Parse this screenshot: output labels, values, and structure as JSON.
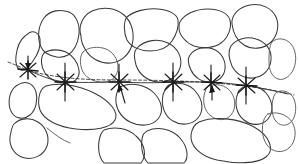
{
  "figure": {
    "background_color": "#ffffff",
    "stone_outline_color": "#3a3a3c",
    "reference_line_color": "#2a2a2c",
    "marker_color": "#171718",
    "width_px": 299,
    "height_px": 164
  },
  "reference_line": {
    "name": "horizontal-sight-line",
    "style": "solid-with-dashed-segments",
    "start": {
      "x": 8,
      "y": 62
    },
    "end": {
      "x": 294,
      "y": 95
    }
  },
  "markers": [
    {
      "id": "marker-1",
      "x": 28,
      "y": 70,
      "has_arrow": true,
      "arrow_direction": "down",
      "tick_length": 16
    },
    {
      "id": "marker-2",
      "x": 65,
      "y": 82,
      "has_arrow": false,
      "arrow_direction": "none",
      "tick_length": 22
    },
    {
      "id": "marker-3",
      "x": 119,
      "y": 82,
      "has_arrow": true,
      "arrow_direction": "down",
      "tick_length": 24
    },
    {
      "id": "marker-4",
      "x": 173,
      "y": 82,
      "has_arrow": false,
      "arrow_direction": "none",
      "tick_length": 24
    },
    {
      "id": "marker-5",
      "x": 211,
      "y": 81,
      "has_arrow": true,
      "arrow_direction": "down",
      "tick_length": 20
    },
    {
      "id": "marker-6",
      "x": 246,
      "y": 85,
      "has_arrow": false,
      "arrow_direction": "none",
      "tick_length": 22
    }
  ],
  "stones": [
    {
      "id": "stone-top-1",
      "row": "top",
      "approx_center": {
        "x": 56,
        "y": 30
      }
    },
    {
      "id": "stone-top-2",
      "row": "top",
      "approx_center": {
        "x": 100,
        "y": 33
      }
    },
    {
      "id": "stone-top-3",
      "row": "top",
      "approx_center": {
        "x": 150,
        "y": 25
      }
    },
    {
      "id": "stone-top-4",
      "row": "top",
      "approx_center": {
        "x": 200,
        "y": 28
      }
    },
    {
      "id": "stone-left-edge",
      "row": "upper-left",
      "approx_center": {
        "x": 28,
        "y": 52
      }
    },
    {
      "id": "stone-mid-1",
      "row": "middle",
      "approx_center": {
        "x": 62,
        "y": 56
      }
    },
    {
      "id": "stone-mid-2",
      "row": "middle",
      "approx_center": {
        "x": 155,
        "y": 57
      }
    },
    {
      "id": "stone-mid-3",
      "row": "middle",
      "approx_center": {
        "x": 205,
        "y": 62
      }
    },
    {
      "id": "stone-mid-4",
      "row": "middle",
      "approx_center": {
        "x": 245,
        "y": 52
      }
    },
    {
      "id": "stone-lower-1",
      "row": "lower",
      "approx_center": {
        "x": 24,
        "y": 95
      }
    },
    {
      "id": "stone-lower-2",
      "row": "lower",
      "approx_center": {
        "x": 78,
        "y": 105
      }
    },
    {
      "id": "stone-lower-3",
      "row": "lower",
      "approx_center": {
        "x": 133,
        "y": 100
      }
    },
    {
      "id": "stone-lower-4",
      "row": "lower",
      "approx_center": {
        "x": 178,
        "y": 100
      }
    },
    {
      "id": "stone-lower-5",
      "row": "lower",
      "approx_center": {
        "x": 215,
        "y": 100
      }
    },
    {
      "id": "stone-lower-6",
      "row": "lower",
      "approx_center": {
        "x": 262,
        "y": 100
      }
    },
    {
      "id": "stone-bottom-1",
      "row": "bottom",
      "approx_center": {
        "x": 28,
        "y": 140
      }
    },
    {
      "id": "stone-bottom-2",
      "row": "bottom",
      "approx_center": {
        "x": 122,
        "y": 145
      }
    },
    {
      "id": "stone-bottom-3",
      "row": "bottom",
      "approx_center": {
        "x": 168,
        "y": 145
      }
    },
    {
      "id": "stone-bottom-4",
      "row": "bottom",
      "approx_center": {
        "x": 232,
        "y": 140
      }
    },
    {
      "id": "stone-bottom-5",
      "row": "bottom",
      "approx_center": {
        "x": 280,
        "y": 128
      }
    }
  ]
}
